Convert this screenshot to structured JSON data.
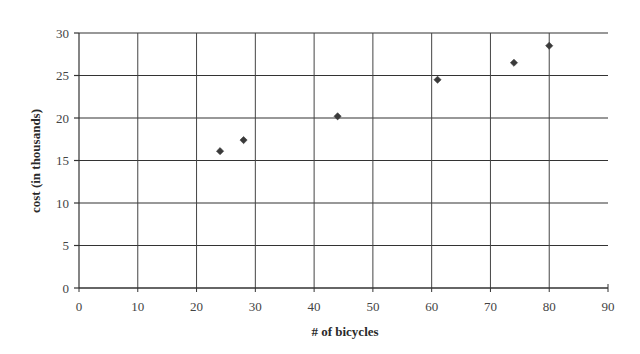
{
  "chart_data": {
    "type": "scatter",
    "title": "",
    "xlabel": "# of bicycles",
    "ylabel": "cost (in thousands)",
    "xlim": [
      0,
      90
    ],
    "ylim": [
      0,
      30
    ],
    "xticks": [
      0,
      10,
      20,
      30,
      40,
      50,
      60,
      70,
      80,
      90
    ],
    "yticks": [
      0,
      5,
      10,
      15,
      20,
      25,
      30
    ],
    "grid": true,
    "legend": null,
    "marker": "diamond",
    "marker_color": "#3a3a3a",
    "series": [
      {
        "name": "cost",
        "points": [
          {
            "x": 24,
            "y": 16.1
          },
          {
            "x": 28,
            "y": 17.4
          },
          {
            "x": 44,
            "y": 20.2
          },
          {
            "x": 61,
            "y": 24.5
          },
          {
            "x": 74,
            "y": 26.5
          },
          {
            "x": 80,
            "y": 28.5
          }
        ]
      }
    ]
  }
}
